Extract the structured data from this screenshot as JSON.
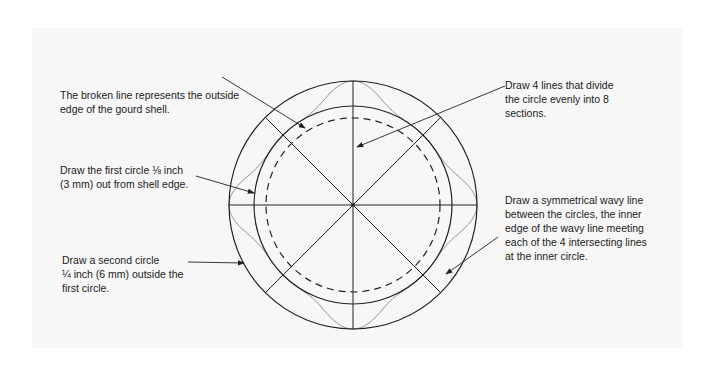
{
  "diagram": {
    "colors": {
      "background": "#f7f7f7",
      "line": "#222222",
      "wave": "#888888"
    },
    "geometry": {
      "center": [
        353,
        205
      ],
      "outer_radius": 124,
      "inner_radius": 99,
      "dashed_radius": 87,
      "section_lines": 4,
      "sections": 8
    },
    "annotations": [
      {
        "id": "broken-line",
        "text": "The broken line represents the outside\nedge of the gourd shell."
      },
      {
        "id": "first-circle",
        "text": "Draw the first circle ⅛ inch\n(3 mm) out from shell edge."
      },
      {
        "id": "second-circle",
        "text": "Draw a second circle\n¼ inch (6 mm) outside the\nfirst circle."
      },
      {
        "id": "four-lines",
        "text": "Draw 4 lines that divide\nthe circle evenly into 8\nsections."
      },
      {
        "id": "wavy-line",
        "text": "Draw a symmetrical wavy line\nbetween the circles, the inner\nedge of the wavy line meeting\neach of the 4 intersecting lines\nat the inner circle."
      }
    ]
  }
}
